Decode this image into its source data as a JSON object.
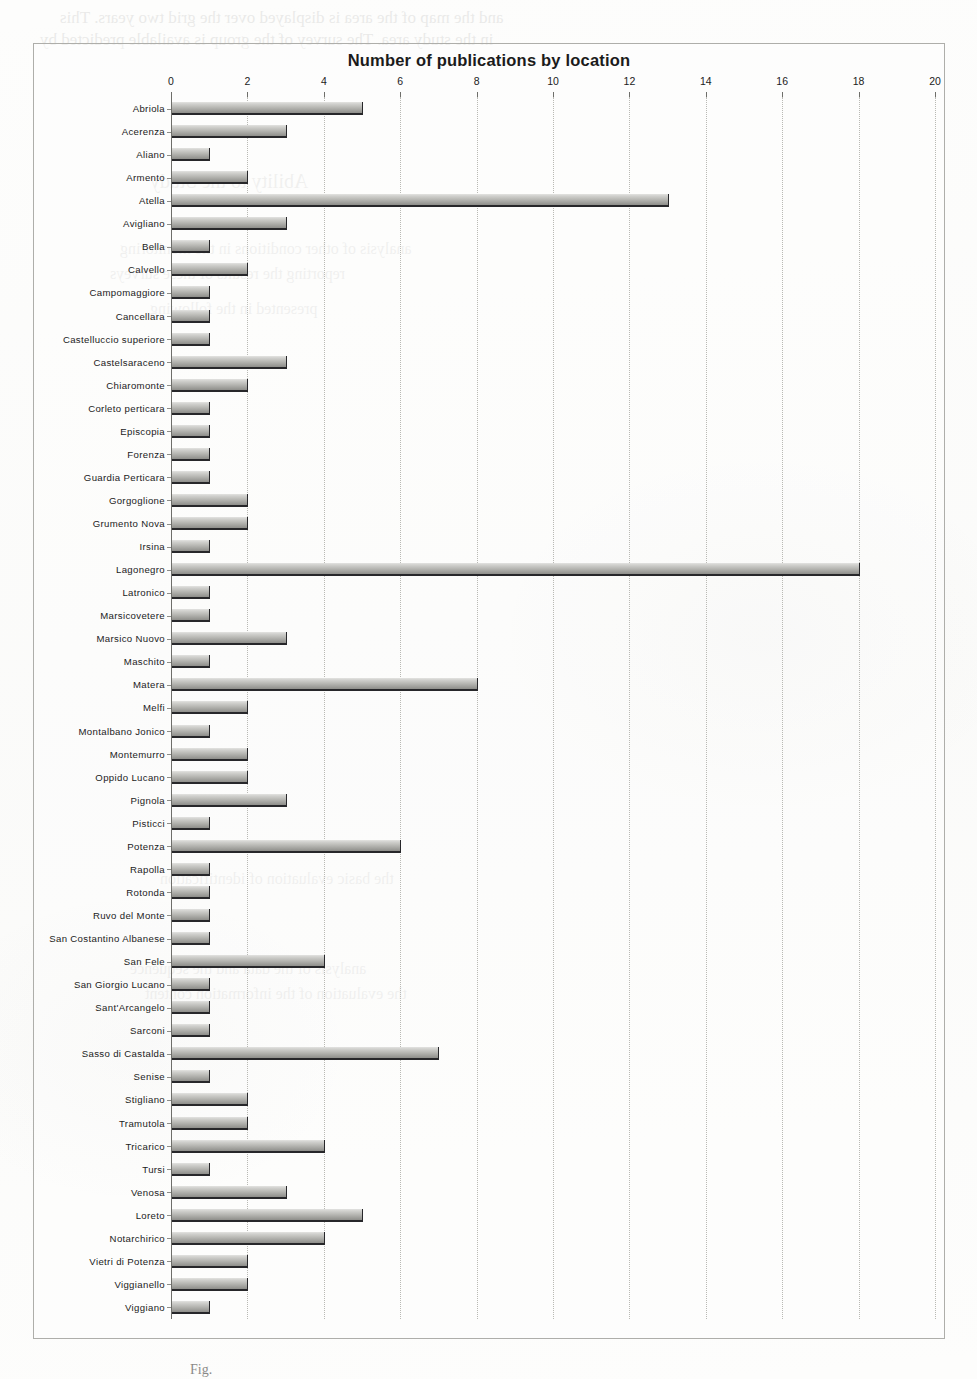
{
  "chart_data": {
    "type": "bar",
    "orientation": "horizontal",
    "title": "Number of publications by location",
    "xlabel": "",
    "ylabel": "",
    "xlim": [
      0,
      20
    ],
    "x_ticks": [
      0,
      2,
      4,
      6,
      8,
      10,
      12,
      14,
      16,
      18,
      20
    ],
    "grid": true,
    "legend": false,
    "bar_color": "#b9b9b5",
    "bar_edge_color": "#27272a",
    "categories": [
      "Abriola",
      "Acerenza",
      "Aliano",
      "Armento",
      "Atella",
      "Avigliano",
      "Bella",
      "Calvello",
      "Campomaggiore",
      "Cancellara",
      "Castelluccio superiore",
      "Castelsaraceno",
      "Chiaromonte",
      "Corleto perticara",
      "Episcopia",
      "Forenza",
      "Guardia Perticara",
      "Gorgoglione",
      "Grumento Nova",
      "Irsina",
      "Lagonegro",
      "Latronico",
      "Marsicovetere",
      "Marsico Nuovo",
      "Maschito",
      "Matera",
      "Melfi",
      "Montalbano Jonico",
      "Montemurro",
      "Oppido Lucano",
      "Pignola",
      "Pisticci",
      "Potenza",
      "Rapolla",
      "Rotonda",
      "Ruvo del Monte",
      "San Costantino Albanese",
      "San Fele",
      "San Giorgio Lucano",
      "Sant'Arcangelo",
      "Sarconi",
      "Sasso di Castalda",
      "Senise",
      "Stigliano",
      "Tramutola",
      "Tricarico",
      "Tursi",
      "Venosa",
      "Loreto",
      "Notarchirico",
      "Vietri di Potenza",
      "Viggianello",
      "Viggiano"
    ],
    "values": [
      5,
      3,
      1,
      2,
      13,
      3,
      1,
      2,
      1,
      1,
      1,
      3,
      2,
      1,
      1,
      1,
      1,
      2,
      2,
      1,
      18,
      1,
      1,
      3,
      1,
      8,
      2,
      1,
      2,
      2,
      3,
      1,
      6,
      1,
      1,
      1,
      1,
      4,
      1,
      1,
      1,
      7,
      1,
      2,
      2,
      4,
      1,
      3,
      5,
      4,
      2,
      2,
      1
    ]
  },
  "caption": "Fig.",
  "bleed_text": [
    "and the map of the area is displayed over the grid two years. This",
    "in the study area. The survey of the group is available predicted by",
    "the other sites"
  ]
}
